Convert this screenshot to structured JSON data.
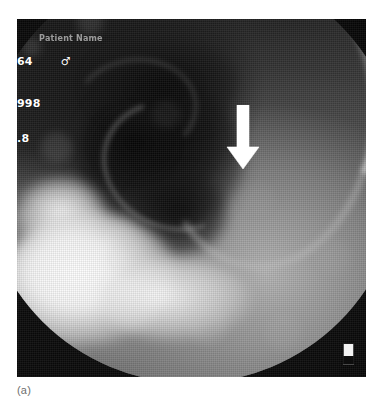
{
  "figure": {
    "caption": "(a)",
    "modality_description": "barium contrast radiograph",
    "colors": {
      "page_background": "#ffffff",
      "film_black": "#050505",
      "annotation_white": "#ffffff",
      "caption_gray": "#6e6e6e"
    }
  },
  "radiograph": {
    "overlay": {
      "patient_name_line": "Patient Name",
      "age": "64",
      "sex_symbol": "♂",
      "date_fragment": "998",
      "extra_fragment": ".8"
    },
    "annotations": {
      "arrow": {
        "icon": "down-arrow-icon",
        "direction": "down",
        "color": "#ffffff"
      },
      "side_marker": {
        "icon": "laterality-marker-icon"
      }
    }
  }
}
